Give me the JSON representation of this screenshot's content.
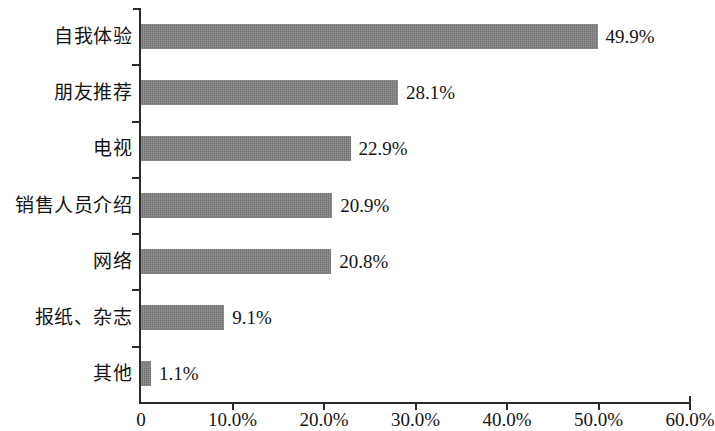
{
  "chart_data": {
    "type": "bar",
    "orientation": "horizontal",
    "title": "",
    "xlabel": "",
    "ylabel": "",
    "categories": [
      "自我体验",
      "朋友推荐",
      "电视",
      "销售人员介绍",
      "网络",
      "报纸、杂志",
      "其他"
    ],
    "values": [
      49.9,
      28.1,
      22.9,
      20.9,
      20.8,
      9.1,
      1.1
    ],
    "value_labels": [
      "49.9%",
      "28.1%",
      "22.9%",
      "20.9%",
      "20.8%",
      "9.1%",
      "1.1%"
    ],
    "xlim": [
      0,
      60
    ],
    "x_ticks": [
      0,
      10,
      20,
      30,
      40,
      50,
      60
    ],
    "x_tick_labels": [
      "0",
      "10.0%",
      "20.0%",
      "30.0%",
      "40.0%",
      "50.0%",
      "60.0%"
    ],
    "grid": false,
    "legend": false,
    "bar_color": "#7d7d7d",
    "axis_color": "#2b2b2b",
    "background": "#ffffff"
  }
}
